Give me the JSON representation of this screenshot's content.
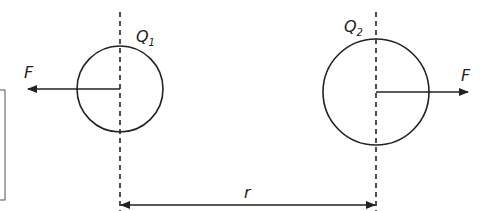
{
  "diagram": {
    "charges": [
      {
        "label": "Q",
        "subscript": "1",
        "force_label": "F",
        "force_direction": "left"
      },
      {
        "label": "Q",
        "subscript": "2",
        "force_label": "F",
        "force_direction": "right"
      }
    ],
    "separation_label": "r",
    "colors": {
      "stroke": "#222222",
      "background": "#ffffff"
    }
  }
}
